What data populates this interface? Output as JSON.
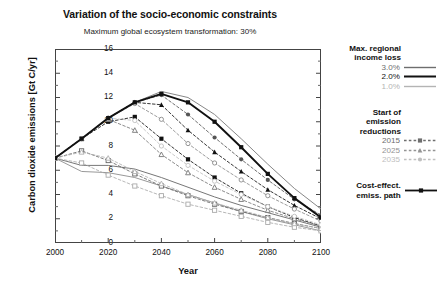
{
  "chart_data": {
    "type": "line",
    "title": "Variation of the socio-economic constraints",
    "subtitle": "Maximum global ecosystem transformation: 30%",
    "xlabel": "Year",
    "ylabel": "Carbon dioxide emissions [Gt C/yr]",
    "xlim": [
      2000,
      2100
    ],
    "ylim": [
      0,
      16
    ],
    "xticks": [
      2000,
      2020,
      2040,
      2060,
      2080,
      2100
    ],
    "yticks": [
      0,
      2,
      4,
      6,
      8,
      10,
      12,
      14,
      16
    ],
    "grid": false,
    "legend_position": "right-outside",
    "x": [
      2000,
      2010,
      2020,
      2030,
      2040,
      2050,
      2060,
      2070,
      2080,
      2090,
      2100
    ],
    "series": [
      {
        "name": "Cost-effect. emiss. path",
        "color": "#111111",
        "style": "solid-bold",
        "marker": "filled-square",
        "values": [
          7.0,
          8.6,
          10.3,
          11.6,
          12.3,
          11.6,
          10.0,
          7.9,
          5.7,
          3.7,
          2.1
        ]
      },
      {
        "name": "3.0% income loss, start 2015",
        "color": "#111111",
        "style": "dashed",
        "marker": "filled-square",
        "values": [
          7.0,
          8.6,
          10.0,
          10.4,
          8.6,
          6.9,
          5.4,
          4.1,
          3.0,
          2.1,
          1.4
        ]
      },
      {
        "name": "2.0% income loss, start 2015",
        "color": "#666666",
        "style": "dashed",
        "marker": "open-square",
        "values": [
          7.0,
          7.6,
          6.8,
          5.7,
          4.7,
          3.9,
          3.2,
          2.6,
          2.1,
          1.6,
          1.2
        ]
      },
      {
        "name": "1.0% income loss, start 2015",
        "color": "#aaaaaa",
        "style": "dashed",
        "marker": "open-square",
        "values": [
          7.0,
          6.6,
          5.6,
          4.7,
          3.9,
          3.2,
          2.7,
          2.2,
          1.7,
          1.3,
          1.0
        ]
      },
      {
        "name": "3.0% income loss, start 2025",
        "color": "#111111",
        "style": "dashed",
        "marker": "filled-triangle",
        "values": [
          7.0,
          8.6,
          10.3,
          11.6,
          11.4,
          9.3,
          7.5,
          5.9,
          4.4,
          3.1,
          2.0
        ]
      },
      {
        "name": "2.0% income loss, start 2025",
        "color": "#777777",
        "style": "dashed",
        "marker": "open-triangle",
        "values": [
          7.0,
          8.6,
          10.2,
          9.3,
          7.3,
          5.8,
          4.6,
          3.6,
          2.7,
          2.0,
          1.4
        ]
      },
      {
        "name": "1.0% income loss, start 2025",
        "color": "#b0b0b0",
        "style": "dashed",
        "marker": "open-triangle",
        "values": [
          7.0,
          7.5,
          7.0,
          5.9,
          4.9,
          4.0,
          3.3,
          2.7,
          2.1,
          1.6,
          1.2
        ]
      },
      {
        "name": "3.0% income loss, start 2035",
        "color": "#555555",
        "style": "dashed",
        "marker": "filled-circle",
        "values": [
          7.0,
          8.6,
          10.3,
          11.6,
          12.2,
          10.6,
          8.7,
          6.9,
          5.2,
          3.6,
          2.3
        ]
      },
      {
        "name": "2.0% income loss, start 2035",
        "color": "#8a8a8a",
        "style": "dashed",
        "marker": "open-circle",
        "values": [
          7.0,
          8.6,
          10.3,
          11.5,
          10.2,
          8.2,
          6.6,
          5.2,
          3.9,
          2.8,
          1.8
        ]
      },
      {
        "name": "1.0% income loss, start 2035",
        "color": "#bfbfbf",
        "style": "dashed",
        "marker": "open-circle",
        "values": [
          7.0,
          8.6,
          10.3,
          10.1,
          8.0,
          6.4,
          5.1,
          4.0,
          3.0,
          2.2,
          1.5
        ]
      },
      {
        "name": "Upper envelope 3.0%",
        "color": "#888888",
        "style": "solid",
        "marker": "none",
        "values": [
          7.0,
          8.6,
          10.3,
          11.6,
          12.5,
          12.0,
          10.6,
          8.6,
          6.5,
          4.5,
          2.8
        ]
      },
      {
        "name": "Lower envelope 2.0%",
        "color": "#777777",
        "style": "solid",
        "marker": "none",
        "values": [
          7.0,
          6.4,
          6.4,
          6.1,
          5.4,
          4.6,
          3.8,
          3.1,
          2.5,
          1.9,
          1.3
        ]
      },
      {
        "name": "Lower envelope 1.0%",
        "color": "#999999",
        "style": "solid",
        "marker": "none",
        "values": [
          7.0,
          5.9,
          5.8,
          5.4,
          4.7,
          4.0,
          3.3,
          2.6,
          2.0,
          1.5,
          1.0
        ]
      }
    ]
  },
  "legend": {
    "section1_title_line1": "Max. regional",
    "section1_title_line2": "income loss",
    "items1": [
      {
        "label": "3.0%",
        "color": "#6e6e6e"
      },
      {
        "label": "2.0%",
        "color": "#111111"
      },
      {
        "label": "1.0%",
        "color": "#b4b4b4"
      }
    ],
    "section2_title_line1": "Start of",
    "section2_title_line2": "emission",
    "section2_title_line3": "reductions",
    "items2": [
      {
        "label": "2015",
        "color": "#6e6e6e",
        "marker": "filled-square"
      },
      {
        "label": "2025",
        "color": "#949494",
        "marker": "filled-triangle"
      },
      {
        "label": "2035",
        "color": "#c0c0c0",
        "marker": "filled-circle"
      }
    ],
    "section3_label_line1": "Cost-effect.",
    "section3_label_line2": "emiss. path",
    "section3_color": "#111111"
  }
}
